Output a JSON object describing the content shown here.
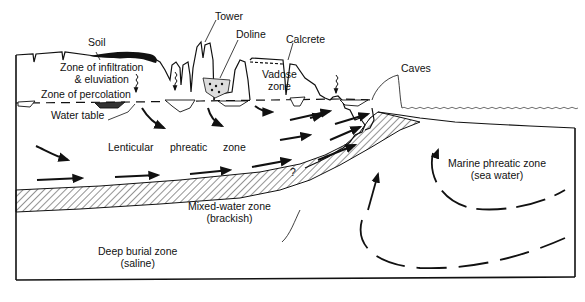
{
  "diagram": {
    "colors": {
      "ink": "#111111",
      "background": "#ffffff"
    },
    "labels": {
      "soil": "Soil",
      "tower": "Tower",
      "doline": "Doline",
      "calcrete": "Calcrete",
      "caves": "Caves",
      "infiltration_line1": "Zone of infiltration",
      "infiltration_line2": "& eluviation",
      "vadose_line1": "Vadose",
      "vadose_line2": "zone",
      "percolation": "Zone of percolation",
      "water_table": "Water table",
      "lenticular_1": "Lenticular",
      "lenticular_2": "phreatic",
      "lenticular_3": "zone",
      "question_mark": "?",
      "mixed_line1": "Mixed-water zone",
      "mixed_line2": "(brackish)",
      "marine_line1": "Marine phreatic zone",
      "marine_line2": "(sea water)",
      "deep_line1": "Deep burial zone",
      "deep_line2": "(saline)"
    }
  }
}
